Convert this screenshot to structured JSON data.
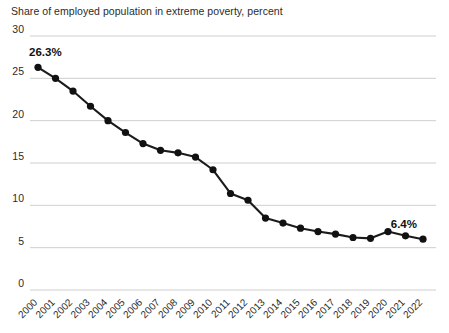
{
  "chart_data": {
    "type": "line",
    "title": "Share of employed population in extreme poverty, percent",
    "xlabel": "",
    "ylabel": "",
    "ylim": [
      0,
      30
    ],
    "yticks": [
      0,
      5,
      10,
      15,
      20,
      25,
      30
    ],
    "ytick_labels": [
      "0",
      "5",
      "10",
      "15",
      "20",
      "25",
      "30"
    ],
    "grid": true,
    "legend": "none",
    "categories": [
      "2000",
      "2001",
      "2002",
      "2003",
      "2004",
      "2005",
      "2006",
      "2007",
      "2008",
      "2009",
      "2010",
      "2011",
      "2012",
      "2013",
      "2014",
      "2015",
      "2016",
      "2017",
      "2018",
      "2019",
      "2020",
      "2021",
      "2022"
    ],
    "values": [
      26.3,
      25.0,
      23.5,
      21.7,
      20.0,
      18.6,
      17.3,
      16.5,
      16.2,
      15.7,
      14.2,
      11.4,
      10.6,
      8.5,
      7.9,
      7.3,
      6.9,
      6.6,
      6.2,
      6.1,
      6.9,
      6.4,
      6.0
    ],
    "annotations": [
      {
        "label": "26.3%",
        "category": "2000",
        "value": 26.3
      },
      {
        "label": "6.4%",
        "category": "2022",
        "value": 6.0
      }
    ],
    "series_color": "#111111",
    "grid_color": "#c9c9c9",
    "background_color": "#ffffff"
  }
}
